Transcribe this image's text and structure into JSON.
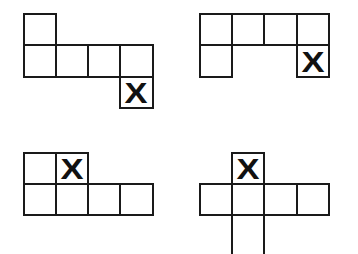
{
  "diagram": {
    "cell_size": 32,
    "line_color": "#1a1a1a",
    "mark_symbol": "X",
    "nets": [
      {
        "id": "net-top-left",
        "origin": [
          23,
          13
        ],
        "cells": [
          {
            "col": 0,
            "row": 0,
            "mark": ""
          },
          {
            "col": 0,
            "row": 1,
            "mark": ""
          },
          {
            "col": 1,
            "row": 1,
            "mark": ""
          },
          {
            "col": 2,
            "row": 1,
            "mark": ""
          },
          {
            "col": 3,
            "row": 1,
            "mark": ""
          },
          {
            "col": 3,
            "row": 2,
            "mark": "X"
          }
        ]
      },
      {
        "id": "net-top-right",
        "origin": [
          199,
          13
        ],
        "cells": [
          {
            "col": 0,
            "row": 0,
            "mark": ""
          },
          {
            "col": 1,
            "row": 0,
            "mark": ""
          },
          {
            "col": 2,
            "row": 0,
            "mark": ""
          },
          {
            "col": 3,
            "row": 0,
            "mark": ""
          },
          {
            "col": 0,
            "row": 1,
            "mark": ""
          },
          {
            "col": 3,
            "row": 1,
            "mark": "X"
          }
        ]
      },
      {
        "id": "net-bottom-left",
        "origin": [
          23,
          152
        ],
        "cells": [
          {
            "col": 0,
            "row": 0,
            "mark": ""
          },
          {
            "col": 1,
            "row": 0,
            "mark": "X"
          },
          {
            "col": 0,
            "row": 1,
            "mark": ""
          },
          {
            "col": 1,
            "row": 1,
            "mark": ""
          },
          {
            "col": 2,
            "row": 1,
            "mark": ""
          },
          {
            "col": 3,
            "row": 1,
            "mark": ""
          }
        ]
      },
      {
        "id": "net-bottom-right",
        "origin": [
          199,
          152
        ],
        "cells": [
          {
            "col": 1,
            "row": 0,
            "mark": "X"
          },
          {
            "col": 0,
            "row": 1,
            "mark": ""
          },
          {
            "col": 1,
            "row": 1,
            "mark": ""
          },
          {
            "col": 2,
            "row": 1,
            "mark": ""
          },
          {
            "col": 3,
            "row": 1,
            "mark": ""
          },
          {
            "col": 1,
            "row": 2,
            "mark": "",
            "clipped": true
          }
        ]
      }
    ]
  }
}
